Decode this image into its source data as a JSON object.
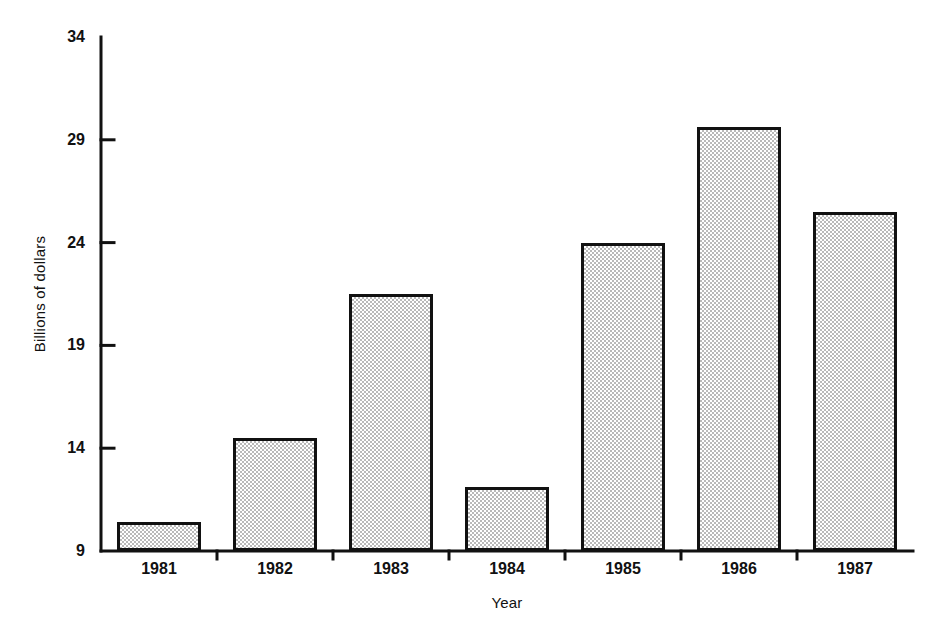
{
  "chart_data": {
    "type": "bar",
    "title": "",
    "subtitle": "",
    "xlabel": "Year",
    "ylabel": "Billions of dollars",
    "categories": [
      "1981",
      "1982",
      "1983",
      "1984",
      "1985",
      "1986",
      "1987"
    ],
    "values": [
      10.4,
      14.5,
      21.5,
      12.1,
      24.0,
      29.6,
      25.5
    ],
    "ylim": [
      9,
      34
    ],
    "yticks": [
      9,
      14,
      19,
      24,
      29,
      34
    ],
    "ytick_labels": [
      "9",
      "14",
      "19",
      "24",
      "29",
      "34"
    ],
    "xtick_labels": [
      "1981",
      "1982",
      "1983",
      "1984",
      "1985",
      "1986",
      "1987"
    ],
    "grid": false,
    "legend": null,
    "legend_position": "none",
    "annotations": [],
    "style": {
      "bar_fill": "#b9b9b9",
      "bar_fill_pattern": "checkerboard-dither",
      "bar_edge": "#111111",
      "axis_color": "#111111",
      "background": "#ffffff",
      "bar_count": 7
    }
  }
}
